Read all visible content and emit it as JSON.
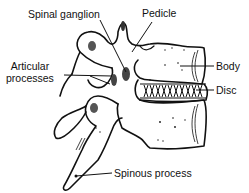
{
  "figure": {
    "type": "anatomical line drawing",
    "labels": [
      {
        "id": "spinal-ganglion",
        "text": "Spinal ganglion"
      },
      {
        "id": "pedicle",
        "text": "Pedicle"
      },
      {
        "id": "articular-processes",
        "lines": [
          "Articular",
          "processes"
        ]
      },
      {
        "id": "body",
        "text": "Body"
      },
      {
        "id": "disc",
        "text": "Disc"
      },
      {
        "id": "spinous-process",
        "text": "Spinous process"
      }
    ]
  },
  "colors": {
    "ink": "#111111",
    "background": "#ffffff"
  }
}
